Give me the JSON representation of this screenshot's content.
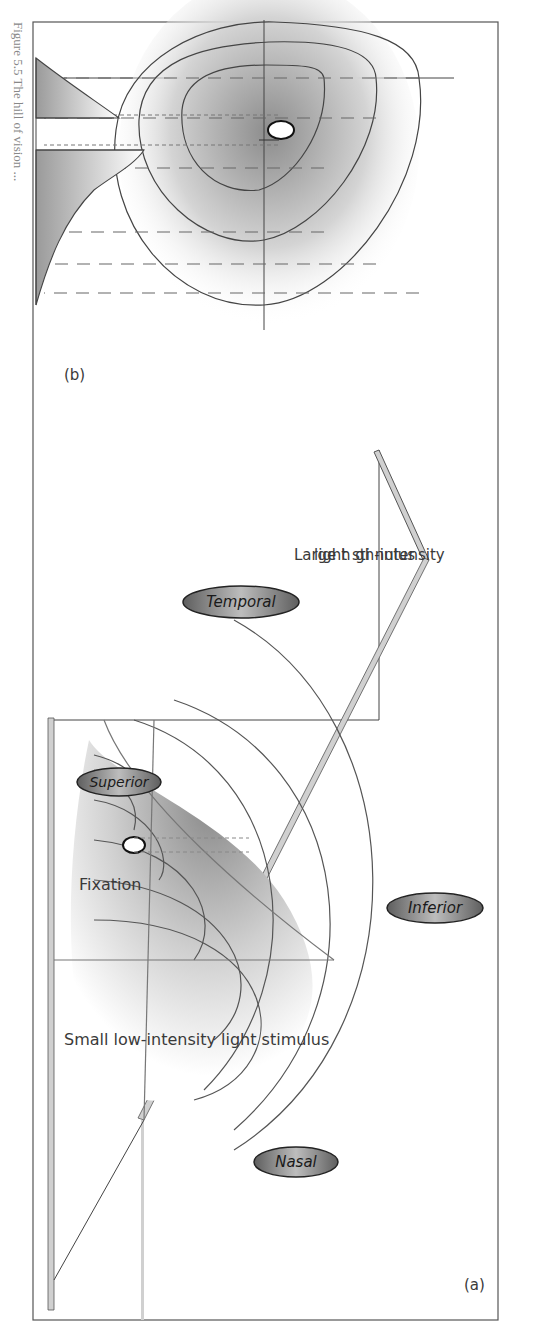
{
  "figure": {
    "panel_a": {
      "label": "(a)",
      "annotations": {
        "small_stimulus": "Small low-intensity light stimulus",
        "fixation": "Fixation",
        "large_stimulus_line1": "Large h gh-intensity",
        "large_stimulus_line2": "light sti nulus"
      },
      "ovals": {
        "superior": "Superior",
        "temporal": "Temporal",
        "inferior": "Inferior",
        "nasal": "Nasal"
      }
    },
    "panel_b": {
      "label": "(b)"
    },
    "caption": "Figure 5.5  The hill of vision ..."
  },
  "colors": {
    "line": "#555555",
    "oval_fill_dark": "#6e6e6e",
    "oval_fill_light": "#b8b8b8",
    "shade": "#9a9a9a",
    "frame": "#555555"
  }
}
